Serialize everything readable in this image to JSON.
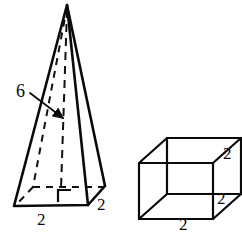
{
  "figure": {
    "background_color": "#ffffff",
    "stroke_color": "#0a0a0a",
    "shapes": [
      {
        "name": "square-pyramid",
        "type": "square pyramid",
        "edge_style": "solid outline with dashed hidden edges",
        "labels": {
          "height": "6",
          "base_front": "2",
          "base_right": "2"
        },
        "has_right_angle_mark": true,
        "altitude_shown": true
      },
      {
        "name": "cube",
        "type": "cube",
        "edge_style": "solid wireframe, all edges visible",
        "labels": {
          "vertical_edge": "2",
          "depth_edge": "2",
          "bottom_edge": "2"
        },
        "has_right_angle_mark": false,
        "altitude_shown": false
      }
    ]
  },
  "pyramid": {
    "height_label": "6",
    "base_front_label": "2",
    "base_right_label": "2"
  },
  "cube": {
    "vertical_label": "2",
    "depth_label": "2",
    "bottom_label": "2"
  }
}
